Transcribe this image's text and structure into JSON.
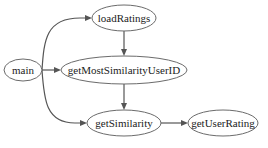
{
  "diagram": {
    "type": "call-graph",
    "nodes": [
      {
        "id": "main",
        "label": "main"
      },
      {
        "id": "loadRatings",
        "label": "loadRatings"
      },
      {
        "id": "getMostSimilarityUserID",
        "label": "getMostSimilarityUserID"
      },
      {
        "id": "getSimilarity",
        "label": "getSimilarity"
      },
      {
        "id": "getUserRating",
        "label": "getUserRating"
      }
    ],
    "edges": [
      {
        "from": "main",
        "to": "loadRatings"
      },
      {
        "from": "main",
        "to": "getMostSimilarityUserID"
      },
      {
        "from": "main",
        "to": "getSimilarity"
      },
      {
        "from": "loadRatings",
        "to": "getMostSimilarityUserID"
      },
      {
        "from": "getMostSimilarityUserID",
        "to": "getSimilarity"
      },
      {
        "from": "getSimilarity",
        "to": "getUserRating"
      }
    ],
    "colors": {
      "node_stroke": "#6b6b6b",
      "edge": "#555555",
      "text": "#222222",
      "background": "#ffffff"
    }
  }
}
